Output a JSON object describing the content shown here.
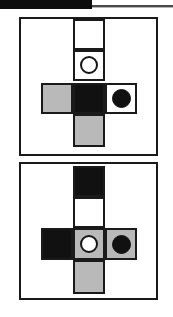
{
  "header": {
    "banner_label": "",
    "rule_name": "horizontal-rule"
  },
  "figure": {
    "caption": "",
    "panel_count": 2,
    "grid_unit_px": 32,
    "colors": {
      "black": "#111111",
      "white": "#ffffff",
      "gray": "#b9b9b9",
      "outline": "#1a1a1a"
    }
  },
  "panels": [
    {
      "id": "panel-top",
      "label": "",
      "cells": [
        {
          "name": "cell-top",
          "fill": "white",
          "marker": "none",
          "row": 0,
          "col": 1
        },
        {
          "name": "cell-upper-middle",
          "fill": "white",
          "marker": "open-circle",
          "row": 1,
          "col": 1
        },
        {
          "name": "cell-left",
          "fill": "gray",
          "marker": "none",
          "row": 2,
          "col": 0
        },
        {
          "name": "cell-center",
          "fill": "black",
          "marker": "none",
          "row": 2,
          "col": 1
        },
        {
          "name": "cell-right",
          "fill": "white",
          "marker": "filled-circle",
          "row": 2,
          "col": 2
        },
        {
          "name": "cell-bottom",
          "fill": "gray",
          "marker": "none",
          "row": 3,
          "col": 1
        }
      ]
    },
    {
      "id": "panel-bottom",
      "label": "",
      "cells": [
        {
          "name": "cell-top",
          "fill": "black",
          "marker": "none",
          "row": 0,
          "col": 1
        },
        {
          "name": "cell-upper-middle",
          "fill": "white",
          "marker": "none",
          "row": 1,
          "col": 1
        },
        {
          "name": "cell-left",
          "fill": "black",
          "marker": "none",
          "row": 2,
          "col": 0
        },
        {
          "name": "cell-center",
          "fill": "gray",
          "marker": "open-circle",
          "row": 2,
          "col": 1
        },
        {
          "name": "cell-right",
          "fill": "gray",
          "marker": "filled-circle",
          "row": 2,
          "col": 2
        },
        {
          "name": "cell-bottom",
          "fill": "gray",
          "marker": "none",
          "row": 3,
          "col": 1
        }
      ]
    }
  ]
}
